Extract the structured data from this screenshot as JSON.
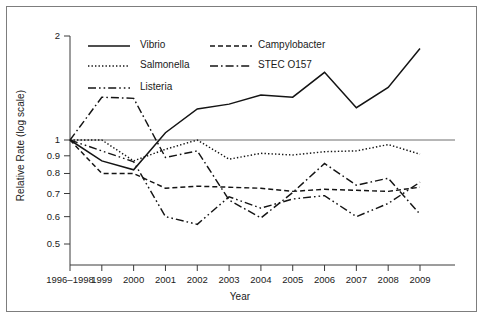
{
  "figure": {
    "ylabel": "Relative Rate (log scale)",
    "xlabel": "Year"
  },
  "legend": {
    "items": [
      {
        "label": "Vibrio",
        "style": "solid"
      },
      {
        "label": "Campylobacter",
        "style": "dashed"
      },
      {
        "label": "Salmonella",
        "style": "dotted"
      },
      {
        "label": "STEC O157",
        "style": "dash-dot"
      },
      {
        "label": "Listeria",
        "style": "dash-dot-dot"
      }
    ]
  },
  "chart_data": {
    "type": "line",
    "title": "",
    "xlabel": "Year",
    "ylabel": "Relative Rate (log scale)",
    "yscale": "log",
    "ylim": [
      0.45,
      2.0
    ],
    "grid": false,
    "legend_position": "top-left",
    "reference_line": 1.0,
    "categories": [
      "1996–1998",
      "1999",
      "2000",
      "2001",
      "2002",
      "2003",
      "2004",
      "2005",
      "2006",
      "2007",
      "2008",
      "2009"
    ],
    "ytick_labels": [
      "2",
      "1",
      "0.9",
      "0.8",
      "0.7",
      "0.6",
      "0.5"
    ],
    "ytick_values": [
      2,
      1,
      0.9,
      0.8,
      0.7,
      0.6,
      0.5
    ],
    "series": [
      {
        "name": "Vibrio",
        "style": "solid",
        "values": [
          1.0,
          0.87,
          0.82,
          1.05,
          1.23,
          1.27,
          1.35,
          1.33,
          1.57,
          1.24,
          1.42,
          1.84
        ]
      },
      {
        "name": "Campylobacter",
        "style": "dashed",
        "values": [
          1.0,
          0.8,
          0.8,
          0.725,
          0.735,
          0.73,
          0.725,
          0.71,
          0.72,
          0.715,
          0.71,
          0.73
        ]
      },
      {
        "name": "Salmonella",
        "style": "dotted",
        "values": [
          1.0,
          1.0,
          0.87,
          0.94,
          1.0,
          0.88,
          0.915,
          0.905,
          0.925,
          0.93,
          0.97,
          0.91
        ]
      },
      {
        "name": "STEC O157",
        "style": "dash-dot",
        "values": [
          1.0,
          1.33,
          1.32,
          0.89,
          0.93,
          0.67,
          0.595,
          0.705,
          0.855,
          0.74,
          0.775,
          0.61
        ]
      },
      {
        "name": "Listeria",
        "style": "dash-dot-dot",
        "values": [
          1.0,
          0.93,
          0.865,
          0.6,
          0.57,
          0.685,
          0.635,
          0.675,
          0.69,
          0.6,
          0.655,
          0.755
        ]
      }
    ]
  }
}
